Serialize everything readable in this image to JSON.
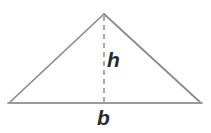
{
  "figure": {
    "name": "triangle-base-height-diagram",
    "type": "geometry-diagram",
    "background_color": "#ffffff",
    "canvas": {
      "width": 211,
      "height": 133
    },
    "shape": {
      "name": "triangle",
      "kind": "triangle",
      "stroke_color": "#8a8a8a",
      "base_stroke_color": "#9a9a9a",
      "fill": "none",
      "stroke_width": 1.6,
      "vertices": [
        {
          "label": "apex",
          "x": 104,
          "y": 14
        },
        {
          "label": "bottom-left",
          "x": 9,
          "y": 103
        },
        {
          "label": "bottom-right",
          "x": 201,
          "y": 103
        }
      ]
    },
    "height_line": {
      "name": "height-dashed-line",
      "stroke_color": "#8a8a8a",
      "stroke_width": 1.5,
      "dash_pattern": "5 4",
      "from": {
        "x": 104,
        "y": 15
      },
      "to": {
        "x": 104,
        "y": 103
      }
    },
    "labels": {
      "height": {
        "text": "h",
        "meaning": "height",
        "color": "#2b2b2b",
        "x": 113,
        "y": 62
      },
      "base": {
        "text": "b",
        "meaning": "base",
        "color": "#2b2b2b",
        "x": 105,
        "y": 118
      }
    }
  }
}
